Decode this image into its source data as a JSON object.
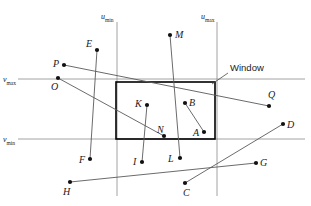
{
  "figure": {
    "colors": {
      "ink": "#1a1a1a",
      "thin_line": "#7a7a7a",
      "window_border": "#000000",
      "background": "#ffffff"
    },
    "window": {
      "label": "Window",
      "x": 116,
      "y": 82,
      "width": 99,
      "height": 57
    },
    "axes": [
      {
        "name": "u-min-line",
        "label_main": "u",
        "label_sub": "min",
        "orient": "vertical",
        "pos": 117,
        "label_x": 101,
        "label_y": 13
      },
      {
        "name": "u-max-line",
        "label_main": "u",
        "label_sub": "max",
        "orient": "vertical",
        "pos": 217,
        "label_x": 201,
        "label_y": 13
      },
      {
        "name": "v-max-line",
        "label_main": "v",
        "label_sub": "max",
        "orient": "horizontal",
        "pos": 79,
        "label_x": 3,
        "label_y": 76
      },
      {
        "name": "v-min-line",
        "label_main": "v",
        "label_sub": "min",
        "orient": "horizontal",
        "pos": 139,
        "label_x": 3,
        "label_y": 136
      }
    ],
    "points": [
      {
        "id": "A",
        "dot_x": 204,
        "dot_y": 132,
        "label_x": 193,
        "label_y": 128
      },
      {
        "id": "B",
        "dot_x": 185,
        "dot_y": 103,
        "label_x": 189,
        "label_y": 98
      },
      {
        "id": "C",
        "dot_x": 185,
        "dot_y": 183,
        "label_x": 183,
        "label_y": 188
      },
      {
        "id": "D",
        "dot_x": 283,
        "dot_y": 124,
        "label_x": 287,
        "label_y": 120
      },
      {
        "id": "E",
        "dot_x": 97,
        "dot_y": 50,
        "label_x": 86,
        "label_y": 39
      },
      {
        "id": "F",
        "dot_x": 90,
        "dot_y": 159,
        "label_x": 79,
        "label_y": 156
      },
      {
        "id": "G",
        "dot_x": 256,
        "dot_y": 163,
        "label_x": 260,
        "label_y": 159
      },
      {
        "id": "H",
        "dot_x": 70,
        "dot_y": 182,
        "label_x": 63,
        "label_y": 187
      },
      {
        "id": "I",
        "dot_x": 142,
        "dot_y": 162,
        "label_x": 133,
        "label_y": 158
      },
      {
        "id": "K",
        "dot_x": 147,
        "dot_y": 105,
        "label_x": 135,
        "label_y": 99
      },
      {
        "id": "L",
        "dot_x": 180,
        "dot_y": 158,
        "label_x": 168,
        "label_y": 155
      },
      {
        "id": "M",
        "dot_x": 170,
        "dot_y": 35,
        "label_x": 175,
        "label_y": 31
      },
      {
        "id": "N",
        "dot_x": 164,
        "dot_y": 136,
        "label_x": 157,
        "label_y": 126
      },
      {
        "id": "O",
        "dot_x": 58,
        "dot_y": 78,
        "label_x": 51,
        "label_y": 83
      },
      {
        "id": "P",
        "dot_x": 64,
        "dot_y": 65,
        "label_x": 53,
        "label_y": 60
      },
      {
        "id": "Q",
        "dot_x": 269,
        "dot_y": 106,
        "label_x": 268,
        "label_y": 91
      }
    ],
    "segments": [
      {
        "name": "segment-P-Q",
        "from": "P",
        "to": "Q",
        "x1": 64,
        "y1": 65,
        "x2": 269,
        "y2": 106
      },
      {
        "name": "segment-O-N",
        "from": "O",
        "to": "N",
        "x1": 58,
        "y1": 78,
        "x2": 164,
        "y2": 136
      },
      {
        "name": "segment-E-F",
        "from": "E",
        "to": "F",
        "x1": 97,
        "y1": 50,
        "x2": 90,
        "y2": 159
      },
      {
        "name": "segment-K-I",
        "from": "K",
        "to": "I",
        "x1": 147,
        "y1": 105,
        "x2": 142,
        "y2": 162
      },
      {
        "name": "segment-M-L",
        "from": "M",
        "to": "L",
        "x1": 170,
        "y1": 35,
        "x2": 180,
        "y2": 158
      },
      {
        "name": "segment-B-A",
        "from": "B",
        "to": "A",
        "x1": 185,
        "y1": 103,
        "x2": 204,
        "y2": 132
      },
      {
        "name": "segment-H-G",
        "from": "H",
        "to": "G",
        "x1": 70,
        "y1": 182,
        "x2": 256,
        "y2": 163
      },
      {
        "name": "segment-C-D",
        "from": "C",
        "to": "D",
        "x1": 185,
        "y1": 183,
        "x2": 283,
        "y2": 124
      }
    ],
    "callout": {
      "label": "Window",
      "label_x": 230,
      "label_y": 68,
      "leader_x1": 228,
      "leader_y1": 73,
      "leader_x2": 212,
      "leader_y2": 84
    }
  }
}
